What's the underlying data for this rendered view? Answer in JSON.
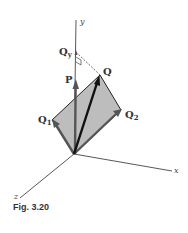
{
  "figure": {
    "caption": "Fig. 3.20",
    "axes": {
      "x": "x",
      "y": "y",
      "z": "z"
    },
    "vectors": {
      "P": "P",
      "Q": "Q",
      "Q1": {
        "base": "Q",
        "sub": "1"
      },
      "Q2": {
        "base": "Q",
        "sub": "2"
      },
      "Qy": {
        "base": "Q",
        "sub": "y"
      }
    },
    "colors": {
      "plane_fill": "#bdbdbd",
      "vector": "#555555",
      "q_vector": "#111111",
      "axis": "#444444"
    }
  }
}
